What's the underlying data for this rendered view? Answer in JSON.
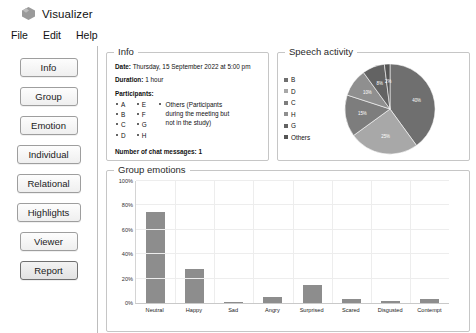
{
  "window": {
    "title": "Visualizer",
    "icon": "cube-icon"
  },
  "menubar": {
    "items": [
      {
        "label": "File"
      },
      {
        "label": "Edit"
      },
      {
        "label": "Help"
      }
    ]
  },
  "sidebar": {
    "items": [
      {
        "label": "Info",
        "active": false
      },
      {
        "label": "Group",
        "active": false
      },
      {
        "label": "Emotion",
        "active": false
      },
      {
        "label": "Individual",
        "active": false
      },
      {
        "label": "Relational",
        "active": false
      },
      {
        "label": "Highlights",
        "active": false
      },
      {
        "label": "Viewer",
        "active": false
      },
      {
        "label": "Report",
        "active": true
      }
    ]
  },
  "info_panel": {
    "title": "Info",
    "date_label": "Date:",
    "date_value": "Thursday, 15 September 2022 at 5:00 pm",
    "duration_label": "Duration:",
    "duration_value": "1 hour",
    "participants_label": "Participants:",
    "participants_col1": [
      "A",
      "B",
      "C",
      "D"
    ],
    "participants_col2": [
      "E",
      "F",
      "G",
      "H"
    ],
    "participants_note": "Others (Participants during the meeting but not in the study)",
    "chat_messages_label": "Number of chat messages:",
    "chat_messages_value": "1"
  },
  "speech_panel": {
    "title": "Speech activity"
  },
  "emotions_panel": {
    "title": "Group emotions"
  },
  "chart_data": [
    {
      "type": "pie",
      "title": "Speech activity",
      "legend_position": "left",
      "categories": [
        "B",
        "D",
        "C",
        "H",
        "G",
        "Others"
      ],
      "values": [
        40,
        25,
        15,
        10,
        8,
        2
      ],
      "labels": [
        "40%",
        "25%",
        "15%",
        "10%",
        "8%",
        "2%"
      ],
      "colors": [
        "#6f6f6f",
        "#a8a8a8",
        "#7d7d7d",
        "#8f8f8f",
        "#636363",
        "#555555"
      ]
    },
    {
      "type": "bar",
      "title": "Group emotions",
      "categories": [
        "Neutral",
        "Happy",
        "Sad",
        "Angry",
        "Surprised",
        "Scared",
        "Disgusted",
        "Contempt"
      ],
      "values": [
        75,
        28,
        1,
        5,
        15,
        3,
        2,
        3
      ],
      "xlabel": "",
      "ylabel": "",
      "ylim": [
        0,
        100
      ],
      "yticks": [
        "0%",
        "20%",
        "40%",
        "60%",
        "80%",
        "100%"
      ],
      "grid": true,
      "bar_color": "#8d8d8d"
    }
  ]
}
